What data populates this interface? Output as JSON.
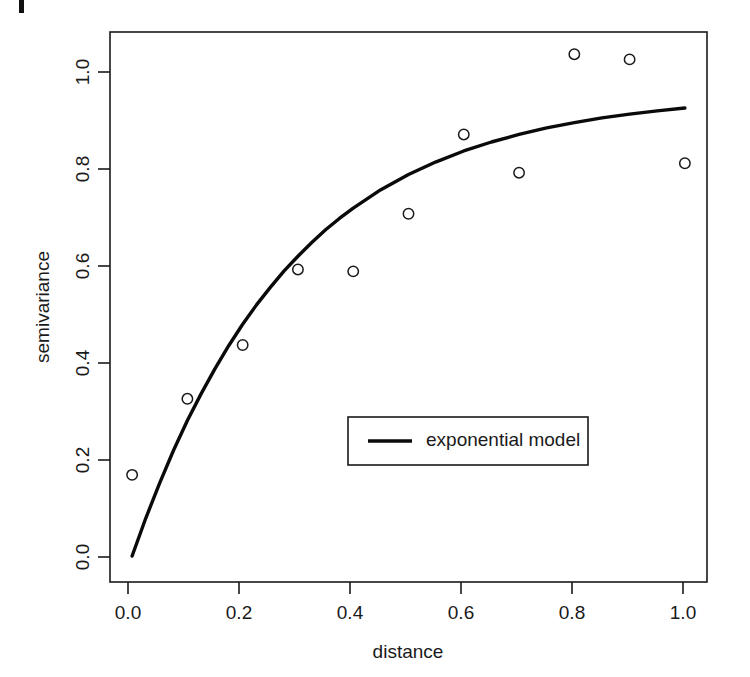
{
  "figure": {
    "background_color": "#ffffff",
    "foreground_color": "#1a1a1a",
    "corner_mark": {
      "present": true,
      "description": "page-edge-tick"
    }
  },
  "chart_data": {
    "type": "scatter",
    "title": "",
    "subtitle": "",
    "xlabel": "distance",
    "ylabel": "semivariance",
    "xlim": [
      -0.04,
      1.04
    ],
    "ylim": [
      -0.055,
      1.11
    ],
    "grid": false,
    "legend_position": "center-right-inside",
    "xticks": [
      0.0,
      0.2,
      0.4,
      0.6,
      0.8,
      1.0
    ],
    "xtick_labels": [
      "0.0",
      "0.2",
      "0.4",
      "0.6",
      "0.8",
      "1.0"
    ],
    "yticks": [
      0.0,
      0.2,
      0.4,
      0.6,
      0.8,
      1.0
    ],
    "ytick_labels": [
      "0.0",
      "0.2",
      "0.4",
      "0.6",
      "0.8",
      "1.0"
    ],
    "series": [
      {
        "name": "empirical semivariance",
        "render": "open-circle-markers",
        "marker": "circle-open",
        "color": "#1a1a1a",
        "in_legend": false,
        "x": [
          0.0,
          0.1,
          0.2,
          0.3,
          0.4,
          0.5,
          0.6,
          0.7,
          0.8,
          0.9,
          1.0
        ],
        "values": [
          0.172,
          0.333,
          0.447,
          0.607,
          0.603,
          0.725,
          0.893,
          0.812,
          1.063,
          1.052,
          0.832
        ]
      },
      {
        "name": "exponential model",
        "render": "line",
        "color": "#0a0a0a",
        "in_legend": true,
        "model": "sill * (1 - exp(-x / range))",
        "sill": 0.975,
        "range": 0.29,
        "x": [
          0.0,
          0.025,
          0.05,
          0.075,
          0.1,
          0.125,
          0.15,
          0.175,
          0.2,
          0.225,
          0.25,
          0.275,
          0.3,
          0.325,
          0.35,
          0.375,
          0.4,
          0.45,
          0.5,
          0.55,
          0.6,
          0.65,
          0.7,
          0.75,
          0.8,
          0.85,
          0.9,
          0.95,
          1.0
        ],
        "values": [
          0.0,
          0.081,
          0.155,
          0.224,
          0.287,
          0.344,
          0.397,
          0.446,
          0.491,
          0.532,
          0.569,
          0.604,
          0.635,
          0.664,
          0.691,
          0.715,
          0.737,
          0.776,
          0.808,
          0.835,
          0.858,
          0.877,
          0.893,
          0.907,
          0.918,
          0.928,
          0.936,
          0.943,
          0.949
        ]
      }
    ],
    "legend_entries": [
      {
        "label": "exponential model",
        "style": "solid-line",
        "color": "#0a0a0a"
      }
    ]
  }
}
